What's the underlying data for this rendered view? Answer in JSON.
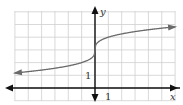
{
  "chart_data": {
    "type": "line",
    "title": "",
    "xlabel": "x",
    "ylabel": "y",
    "x_tick_label": "1",
    "y_tick_label": "1",
    "xlim": [
      -6,
      6
    ],
    "ylim": [
      -1,
      6
    ],
    "grid": true,
    "legend": null,
    "series": [
      {
        "name": "y = cbrt(x) + 3",
        "x": [
          -6,
          -5,
          -4,
          -3,
          -2,
          -1,
          -0.5,
          -0.1,
          0,
          0.1,
          0.5,
          1,
          2,
          3,
          4,
          5,
          6
        ],
        "values": [
          1.18,
          1.29,
          1.41,
          1.56,
          1.74,
          2.0,
          2.21,
          2.54,
          3.0,
          3.46,
          3.79,
          4.0,
          4.26,
          4.44,
          4.59,
          4.71,
          4.82
        ],
        "color": "#6a6a6a",
        "arrows": "both"
      }
    ]
  },
  "labels": {
    "x_axis": "x",
    "y_axis": "y",
    "x_unit": "1",
    "y_unit": "1"
  },
  "colors": {
    "grid": "#cfcfcf",
    "axes": "#111111",
    "curve": "#6a6a6a"
  }
}
